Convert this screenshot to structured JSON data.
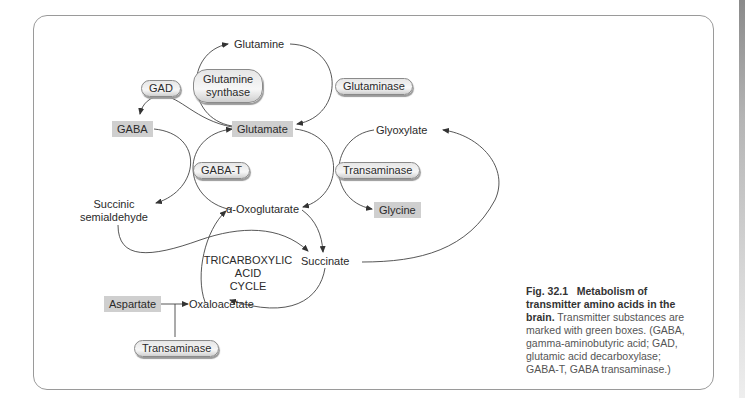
{
  "figure": {
    "nodes": {
      "glutamine": "Glutamine",
      "glutamate": "Glutamate",
      "gaba": "GABA",
      "glyoxylate": "Glyoxylate",
      "glycine": "Glycine",
      "succinic_semialdehyde_line1": "Succinic",
      "succinic_semialdehyde_line2": "semialdehyde",
      "alpha_oxoglutarate": "α-Oxoglutarate",
      "succinate": "Succinate",
      "oxaloacetate": "Oxaloacetate",
      "aspartate": "Aspartate"
    },
    "enzymes": {
      "gad": "GAD",
      "glutamine_synthase_line1": "Glutamine",
      "glutamine_synthase_line2": "synthase",
      "glutaminase": "Glutaminase",
      "gaba_t": "GABA-T",
      "transaminase_glycine": "Transaminase",
      "transaminase_aspartate": "Transaminase"
    },
    "tca_cycle": {
      "line1": "TRICARBOXYLIC",
      "line2": "ACID",
      "line3": "CYCLE"
    },
    "transmitter_box_color": "#cfcfcf",
    "caption": {
      "label": "Fig. 32.1",
      "title": "Metabolism of transmitter amino acids in the brain.",
      "text": "Transmitter substances are marked with green boxes. (GABA, gamma-aminobutyric acid; GAD, glutamic acid decarboxylase; GABA-T, GABA transaminase.)"
    }
  }
}
